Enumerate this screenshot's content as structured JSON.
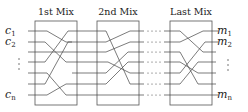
{
  "diagram": {
    "type": "mix-network",
    "mixes": [
      {
        "label": "1st Mix"
      },
      {
        "label": "2nd Mix"
      },
      {
        "label": "Last Mix"
      }
    ],
    "inputs": {
      "first": {
        "base": "c",
        "sub": "1"
      },
      "second": {
        "base": "c",
        "sub": "2"
      },
      "last": {
        "base": "c",
        "sub": "n"
      },
      "ellipsis": "⋮"
    },
    "outputs": {
      "first": {
        "base": "m",
        "sub": "1"
      },
      "second": {
        "base": "m",
        "sub": "2"
      },
      "last": {
        "base": "m",
        "sub": "n"
      },
      "ellipsis": "⋮"
    },
    "between_ellipsis": "· · · ·",
    "wire_count": 7
  }
}
